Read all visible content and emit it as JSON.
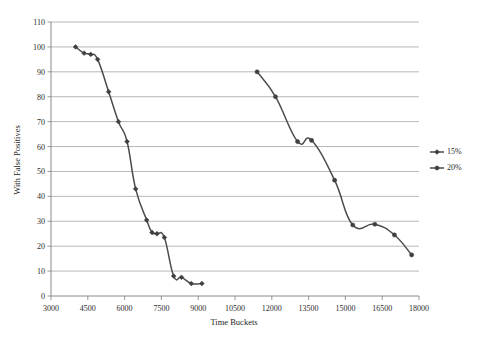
{
  "chart_data": {
    "type": "line",
    "title": "",
    "xlabel": "Time Buckets",
    "ylabel": "With False Positives",
    "xlim": [
      3000,
      18000
    ],
    "ylim": [
      0,
      110
    ],
    "xticks": [
      3000,
      4500,
      6000,
      7500,
      9000,
      10500,
      12000,
      13500,
      15000,
      16500,
      18000
    ],
    "yticks": [
      0,
      10,
      20,
      30,
      40,
      50,
      60,
      70,
      80,
      90,
      100,
      110
    ],
    "xtick_labels": [
      "3000",
      "4500",
      "6000",
      "7500",
      "9000",
      "10500",
      "12000",
      "13500",
      "15000",
      "16500",
      "18000"
    ],
    "ytick_labels": [
      "0",
      "10",
      "20",
      "30",
      "40",
      "50",
      "60",
      "70",
      "80",
      "90",
      "100",
      "110"
    ],
    "grid": "horizontal",
    "legend_position": "right",
    "series": [
      {
        "name": "15%",
        "marker": "diamond",
        "color": "#3f3f3f",
        "points": [
          [
            4000,
            100
          ],
          [
            4350,
            97.5
          ],
          [
            4620,
            97
          ],
          [
            4900,
            95
          ],
          [
            5350,
            82
          ],
          [
            5750,
            70
          ],
          [
            6100,
            62
          ],
          [
            6450,
            43
          ],
          [
            6900,
            30.5
          ],
          [
            7120,
            25.5
          ],
          [
            7320,
            25
          ],
          [
            7620,
            23.5
          ],
          [
            8000,
            8
          ],
          [
            8320,
            7.5
          ],
          [
            8720,
            5
          ],
          [
            9150,
            5
          ]
        ]
      },
      {
        "name": "20%",
        "marker": "circle",
        "color": "#3f3f3f",
        "points": [
          [
            11400,
            90
          ],
          [
            12150,
            80
          ],
          [
            13050,
            62
          ],
          [
            13620,
            62.5
          ],
          [
            14560,
            46.5
          ],
          [
            15300,
            28.5
          ],
          [
            16200,
            28.8
          ],
          [
            17000,
            24.5
          ],
          [
            17700,
            16.5
          ]
        ]
      }
    ]
  },
  "legend": {
    "items": [
      {
        "label": "15%"
      },
      {
        "label": "20%"
      }
    ]
  },
  "axes": {
    "x_title": "Time Buckets",
    "y_title": "With False Positives"
  }
}
